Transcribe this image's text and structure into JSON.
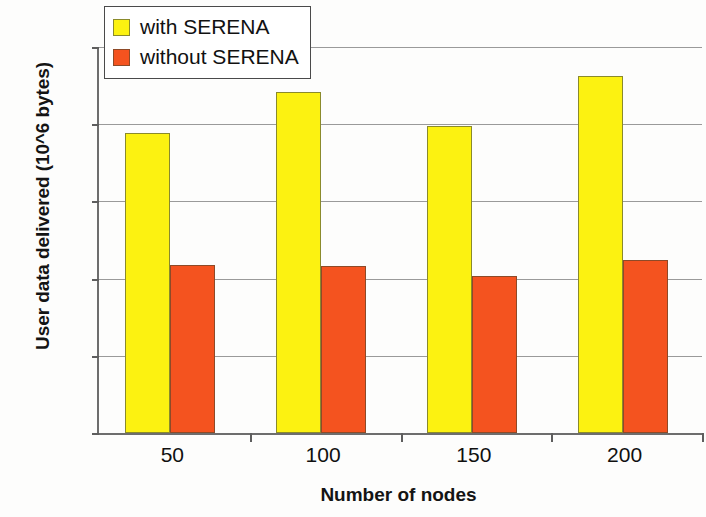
{
  "chart_data": {
    "type": "bar",
    "title": "",
    "subtitle": "",
    "xlabel": "Number of nodes",
    "ylabel": "User data delivered (10^6 bytes)",
    "categories": [
      "50",
      "100",
      "150",
      "200"
    ],
    "series": [
      {
        "name": "with SERENA",
        "color": "#FCF211",
        "values": [
          1.94,
          2.21,
          1.99,
          2.31
        ]
      },
      {
        "name": "without SERENA",
        "color": "#F4531F",
        "values": [
          1.09,
          1.08,
          1.02,
          1.12
        ]
      }
    ],
    "ylim": [
      0,
      2.5
    ],
    "ytick_values": [
      0,
      0.5,
      1,
      1.5,
      2,
      2.5
    ],
    "ytick_labels": [
      "0",
      "0,5",
      "1",
      "1,5",
      "2",
      "2,5"
    ],
    "grid": true,
    "grid_axis": "y",
    "legend_position": "top-left",
    "decimal_separator": ","
  },
  "legend": {
    "items": [
      {
        "label": "with SERENA"
      },
      {
        "label": "without SERENA"
      }
    ]
  },
  "axes": {
    "x_title": "Number of nodes",
    "y_title": "User data delivered (10^6 bytes)"
  }
}
